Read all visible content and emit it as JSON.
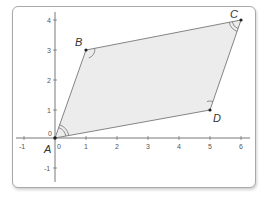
{
  "diagram": {
    "x_ticks": [
      "-1",
      "0",
      "1",
      "2",
      "3",
      "4",
      "5",
      "6"
    ],
    "y_ticks": [
      "-1",
      "0",
      "1",
      "2",
      "3",
      "4"
    ],
    "points": [
      {
        "label": "A",
        "x": 0,
        "y": 0
      },
      {
        "label": "B",
        "x": 1,
        "y": 3
      },
      {
        "label": "C",
        "x": 6,
        "y": 4
      },
      {
        "label": "D",
        "x": 5,
        "y": 1
      }
    ],
    "colors": {
      "fill": "#ececec",
      "edge": "#777777",
      "axis": "#555555",
      "point": "#222222"
    }
  }
}
